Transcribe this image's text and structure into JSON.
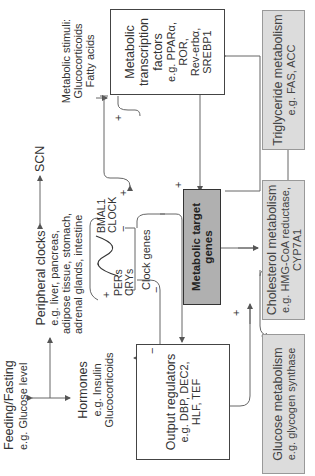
{
  "feeding": {
    "title": "Feeding/Fasting",
    "sub": "e.g. Glucose level"
  },
  "hormones": {
    "title": "Hormones",
    "sub1": "e.g. Insulin",
    "sub2": "Glucocorticoids"
  },
  "peripheral": {
    "title": "Peripheral clocks",
    "line1": "e.g. liver, pancreas,",
    "line2": "adipose tissue, stomach,",
    "line3": "adrenal glands, intestine"
  },
  "scn": "SCN",
  "stimuli": {
    "title": "Metabolic stimuli:",
    "line1": "Glucocorticoids",
    "line2": "Fatty acids"
  },
  "clock": {
    "pers": "PERs",
    "crys": "CRYs",
    "bmal1": "BMAL1",
    "clock": "CLOCK",
    "label": "Clock genes"
  },
  "transcription": {
    "line1": "Metabolic",
    "line2": "transcription",
    "line3": "factors",
    "line4": "e.g. PPARα,",
    "line5": "ROR,",
    "line6": "Rev-erbα,",
    "line7": "SREBP1"
  },
  "output": {
    "line1": "Output regulators",
    "line2": "e.g. DBP, DEC2,",
    "line3": "HLF, TEF"
  },
  "target": {
    "line1": "Metabolic target",
    "line2": "genes"
  },
  "glucose": {
    "title": "Glucose metabolism",
    "sub": "e.g. glycogen synthase"
  },
  "cholesterol": {
    "title": "Cholesterol metabolism",
    "sub1": "e.g. HMG-CoA reductase,",
    "sub2": "CYP7A1"
  },
  "triglyceride": {
    "title": "Triglyceride metabolism",
    "sub": "e.g. FAS, ACC"
  },
  "signs": {
    "plus": "+",
    "minus": "−"
  },
  "colors": {
    "box_fill": "#ffffff",
    "target_fill": "#b0b0b0",
    "metabolism_fill": "#dcdcdc",
    "line": "#555555"
  }
}
